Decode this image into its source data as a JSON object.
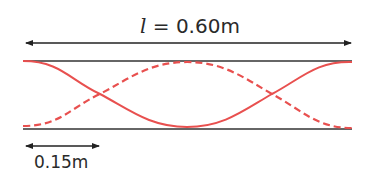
{
  "diagram": {
    "length_label": {
      "symbol": "l",
      "equals": " = ",
      "value": "0.60m"
    },
    "segment_label": "0.15m",
    "colors": {
      "wave": "#e8504f",
      "line": "#222222",
      "text": "#2a2a2a"
    },
    "wave": {
      "type": "standing-wave",
      "solid_curve": "cosine (top at ends, trough at center)",
      "dashed_curve": "inverted cosine (bottom at ends, crest at center)"
    }
  }
}
